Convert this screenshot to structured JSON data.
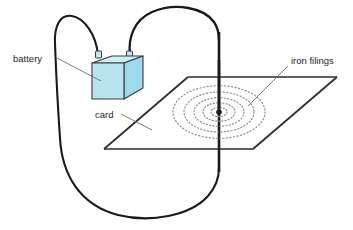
{
  "figure": {
    "background_color": "#ffffff"
  },
  "labels": {
    "battery": "battery",
    "card": "card",
    "iron_filings": "iron filings"
  },
  "colors": {
    "battery_front": "#b8e4f0",
    "battery_top": "#cdeef7",
    "battery_side": "#9ed9ec",
    "battery_stroke": "#3a3a3a",
    "wire": "#1a1a1a",
    "card_stroke": "#2b2b2b",
    "filings": "#8a8a8a",
    "leader": "#6d6d6d",
    "text": "#231f20",
    "terminal": "#4a4a4a"
  },
  "parts": {
    "battery": {
      "name": "battery",
      "shape": "cube",
      "terminals": 2
    },
    "card": {
      "name": "card",
      "shape": "parallelogram"
    },
    "iron_filings": {
      "name": "iron filings",
      "pattern": "concentric dotted ellipses",
      "ring_count": 5
    },
    "wire": {
      "name": "wire",
      "path": "loop from battery terminals through vertical rod piercing the card"
    }
  }
}
